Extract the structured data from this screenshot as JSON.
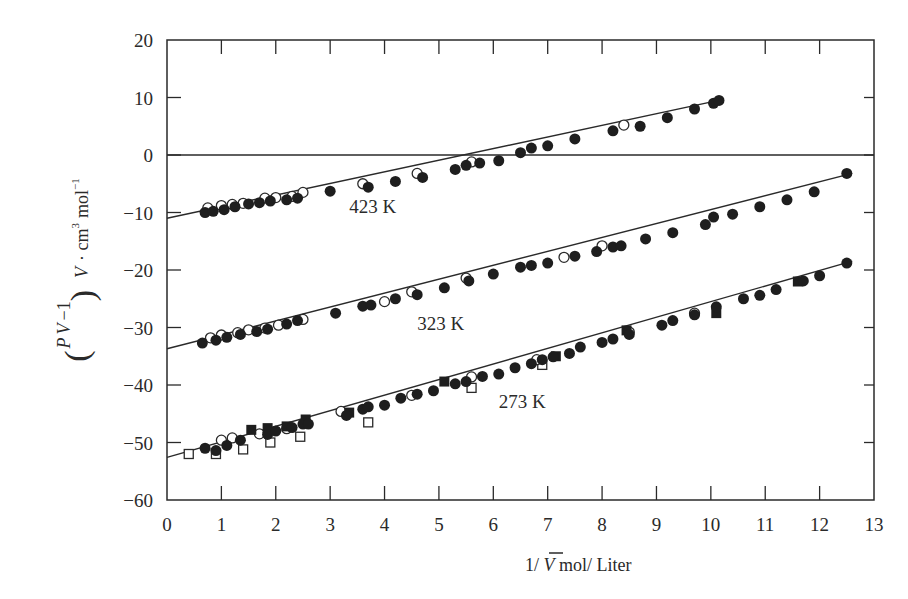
{
  "chart_data": {
    "type": "scatter",
    "title": "",
    "xlabel": "1/ V̄  mol/ Liter",
    "ylabel": "(PV̄/RT* − 1) V̄ · cm³ mol⁻¹",
    "xlim": [
      0,
      13
    ],
    "ylim": [
      -60,
      20
    ],
    "x_ticks": [
      0,
      1,
      2,
      3,
      4,
      5,
      6,
      7,
      8,
      9,
      10,
      11,
      12,
      13
    ],
    "y_ticks": [
      20,
      10,
      0,
      -10,
      -20,
      -30,
      -40,
      -50,
      -60
    ],
    "grid": false,
    "zero_line": true,
    "legend": null,
    "series": [
      {
        "name": "423 K",
        "label_pos": [
          3.35,
          -10.0
        ],
        "fit": {
          "intercept": -11.0,
          "slope": 2.02,
          "x_range": [
            0,
            10.1
          ]
        },
        "filled_circles": [
          [
            0.7,
            -10.0
          ],
          [
            0.85,
            -9.8
          ],
          [
            1.05,
            -9.5
          ],
          [
            1.25,
            -9.0
          ],
          [
            1.5,
            -8.5
          ],
          [
            1.7,
            -8.3
          ],
          [
            1.9,
            -8.0
          ],
          [
            2.2,
            -7.8
          ],
          [
            2.4,
            -7.5
          ],
          [
            3.0,
            -6.3
          ],
          [
            3.7,
            -5.6
          ],
          [
            4.2,
            -4.6
          ],
          [
            4.7,
            -3.9
          ],
          [
            5.3,
            -2.5
          ],
          [
            5.5,
            -1.8
          ],
          [
            5.75,
            -1.4
          ],
          [
            6.1,
            -1.0
          ],
          [
            6.5,
            0.4
          ],
          [
            6.7,
            1.2
          ],
          [
            7.0,
            1.6
          ],
          [
            7.5,
            2.8
          ],
          [
            8.2,
            4.2
          ],
          [
            8.7,
            5.0
          ],
          [
            9.2,
            6.5
          ],
          [
            9.7,
            8.0
          ],
          [
            10.05,
            9.0
          ],
          [
            10.15,
            9.5
          ]
        ],
        "open_circles": [
          [
            0.75,
            -9.2
          ],
          [
            1.0,
            -8.8
          ],
          [
            1.2,
            -8.6
          ],
          [
            1.4,
            -8.4
          ],
          [
            1.8,
            -7.5
          ],
          [
            2.0,
            -7.4
          ],
          [
            2.3,
            -7.2
          ],
          [
            2.5,
            -6.5
          ],
          [
            3.6,
            -5.0
          ],
          [
            4.6,
            -3.2
          ],
          [
            5.6,
            -1.2
          ],
          [
            8.4,
            5.2
          ]
        ],
        "open_squares": [],
        "filled_squares": []
      },
      {
        "name": "323 K",
        "label_pos": [
          4.6,
          -30.5
        ],
        "fit": {
          "intercept": -33.7,
          "slope": 2.42,
          "x_range": [
            0,
            12.6
          ]
        },
        "filled_circles": [
          [
            0.65,
            -32.7
          ],
          [
            0.9,
            -32.2
          ],
          [
            1.1,
            -31.7
          ],
          [
            1.35,
            -31.2
          ],
          [
            1.65,
            -30.7
          ],
          [
            1.85,
            -30.3
          ],
          [
            2.2,
            -29.4
          ],
          [
            2.4,
            -28.8
          ],
          [
            3.1,
            -27.5
          ],
          [
            3.6,
            -26.3
          ],
          [
            3.75,
            -26.1
          ],
          [
            4.2,
            -25.0
          ],
          [
            4.6,
            -24.3
          ],
          [
            5.1,
            -23.1
          ],
          [
            5.55,
            -21.9
          ],
          [
            6.0,
            -20.7
          ],
          [
            6.5,
            -19.5
          ],
          [
            6.7,
            -19.2
          ],
          [
            7.0,
            -18.8
          ],
          [
            7.5,
            -17.6
          ],
          [
            7.9,
            -16.8
          ],
          [
            8.2,
            -16.0
          ],
          [
            8.35,
            -15.8
          ],
          [
            8.8,
            -14.6
          ],
          [
            9.3,
            -13.5
          ],
          [
            9.9,
            -12.1
          ],
          [
            10.05,
            -10.8
          ],
          [
            10.4,
            -10.3
          ],
          [
            10.9,
            -9.0
          ],
          [
            11.4,
            -7.8
          ],
          [
            11.9,
            -6.4
          ],
          [
            12.5,
            -3.2
          ]
        ],
        "open_circles": [
          [
            0.8,
            -31.8
          ],
          [
            1.0,
            -31.3
          ],
          [
            1.3,
            -30.9
          ],
          [
            1.5,
            -30.4
          ],
          [
            1.8,
            -30.1
          ],
          [
            2.05,
            -29.6
          ],
          [
            2.5,
            -28.6
          ],
          [
            4.0,
            -25.5
          ],
          [
            4.5,
            -23.8
          ],
          [
            5.5,
            -21.4
          ],
          [
            7.3,
            -17.8
          ],
          [
            8.0,
            -15.8
          ]
        ],
        "open_squares": [],
        "filled_squares": []
      },
      {
        "name": "273 K",
        "label_pos": [
          6.1,
          -44.0
        ],
        "fit": {
          "intercept": -52.6,
          "slope": 2.71,
          "x_range": [
            0,
            12.6
          ]
        },
        "filled_circles": [
          [
            0.7,
            -51.0
          ],
          [
            0.9,
            -51.4
          ],
          [
            1.1,
            -50.5
          ],
          [
            1.35,
            -49.6
          ],
          [
            1.85,
            -48.6
          ],
          [
            2.0,
            -48.0
          ],
          [
            2.3,
            -47.4
          ],
          [
            2.5,
            -46.8
          ],
          [
            2.6,
            -46.8
          ],
          [
            3.3,
            -45.3
          ],
          [
            3.6,
            -44.2
          ],
          [
            3.7,
            -43.8
          ],
          [
            4.0,
            -43.5
          ],
          [
            4.3,
            -42.3
          ],
          [
            4.6,
            -41.6
          ],
          [
            4.9,
            -41.0
          ],
          [
            5.3,
            -39.8
          ],
          [
            5.5,
            -39.4
          ],
          [
            5.8,
            -38.5
          ],
          [
            6.1,
            -38.1
          ],
          [
            6.4,
            -37.0
          ],
          [
            6.7,
            -36.3
          ],
          [
            6.9,
            -35.6
          ],
          [
            7.1,
            -35.1
          ],
          [
            7.4,
            -34.5
          ],
          [
            7.6,
            -33.4
          ],
          [
            8.0,
            -32.6
          ],
          [
            8.2,
            -32.0
          ],
          [
            8.5,
            -31.2
          ],
          [
            9.1,
            -29.6
          ],
          [
            9.3,
            -28.8
          ],
          [
            9.7,
            -27.8
          ],
          [
            10.1,
            -26.4
          ],
          [
            10.6,
            -25.0
          ],
          [
            10.9,
            -24.4
          ],
          [
            11.2,
            -23.4
          ],
          [
            11.7,
            -21.9
          ],
          [
            12.0,
            -21.0
          ],
          [
            12.5,
            -18.8
          ]
        ],
        "open_circles": [
          [
            1.0,
            -49.6
          ],
          [
            1.2,
            -49.2
          ],
          [
            1.7,
            -48.5
          ],
          [
            2.2,
            -47.6
          ],
          [
            3.2,
            -44.6
          ],
          [
            4.5,
            -41.8
          ],
          [
            5.6,
            -38.6
          ],
          [
            6.8,
            -35.6
          ],
          [
            8.5,
            -30.8
          ],
          [
            9.7,
            -27.5
          ]
        ],
        "open_squares": [
          [
            0.4,
            -52.0
          ],
          [
            0.9,
            -52.0
          ],
          [
            1.4,
            -51.2
          ],
          [
            1.9,
            -50.0
          ],
          [
            2.45,
            -49.0
          ],
          [
            3.7,
            -46.5
          ],
          [
            5.6,
            -40.5
          ],
          [
            6.9,
            -36.5
          ]
        ],
        "filled_squares": [
          [
            1.55,
            -47.8
          ],
          [
            1.85,
            -47.5
          ],
          [
            2.2,
            -47.2
          ],
          [
            2.55,
            -46.0
          ],
          [
            3.35,
            -44.8
          ],
          [
            5.1,
            -39.4
          ],
          [
            7.15,
            -35.0
          ],
          [
            8.45,
            -30.5
          ],
          [
            10.1,
            -27.5
          ],
          [
            11.6,
            -22.0
          ]
        ]
      }
    ]
  }
}
